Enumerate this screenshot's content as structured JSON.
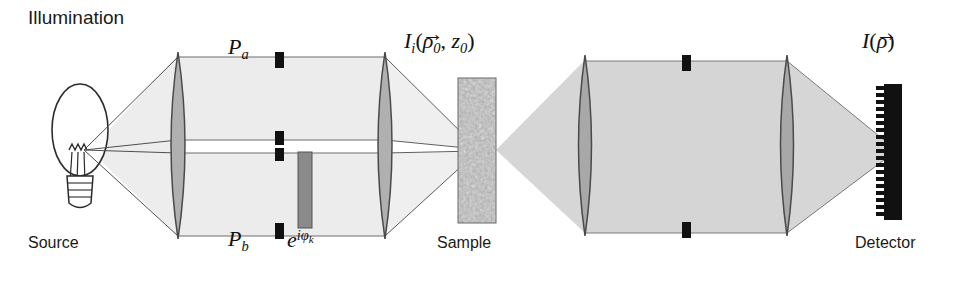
{
  "figure": {
    "width": 975,
    "height": 286,
    "background": "#ffffff",
    "title": "Illumination"
  },
  "colors": {
    "beam_fill": "#e9e9e9",
    "beam_fill_dark": "#d3d3d3",
    "lens_fill": "#b3b3b3",
    "lens_stroke": "#555555",
    "stop_black": "#111111",
    "phase_mask": "#8c8c8c",
    "ray_stroke": "#666666",
    "outline": "#2b2b2b",
    "text": "#1a1a1a",
    "detector_body": "#111111"
  },
  "labels": {
    "illumination": "Illumination",
    "source": "Source",
    "sample": "Sample",
    "detector": "Detector",
    "aperture_top": {
      "symbol": "P",
      "subscript": "a"
    },
    "aperture_bottom": {
      "symbol": "P",
      "subscript": "b"
    },
    "phase_mask": {
      "base": "e",
      "exponent": "iφ",
      "exponent_sub": "k"
    },
    "illumination_intensity": {
      "symbol": "I",
      "subscript": "i",
      "open": "(",
      "arg1": "ρ",
      "arg1_sub": "0",
      "comma": ", ",
      "arg2": "z",
      "arg2_sub": "0",
      "close": ")"
    },
    "detected_intensity": {
      "symbol": "I",
      "open": "(",
      "arg1": "ρ",
      "close": ")"
    },
    "vector_arrow": "→"
  },
  "components": [
    {
      "name": "source-bulb",
      "type": "incandescent-lamp",
      "label": "Source",
      "cx": 82,
      "cy": 145
    },
    {
      "name": "lens-1",
      "type": "biconvex-lens",
      "cx": 178,
      "cy": 145,
      "height": 185
    },
    {
      "name": "aperture-stop-pa",
      "type": "aperture-stop",
      "cx": 280,
      "cy": 62,
      "label": "P_a"
    },
    {
      "name": "aperture-stop-mid-upper",
      "type": "aperture-stop",
      "cx": 280,
      "cy": 139
    },
    {
      "name": "aperture-stop-mid-lower",
      "type": "aperture-stop",
      "cx": 280,
      "cy": 154
    },
    {
      "name": "aperture-stop-pb",
      "type": "aperture-stop",
      "cx": 280,
      "cy": 231,
      "label": "P_b"
    },
    {
      "name": "phase-mask",
      "type": "phase-plate",
      "cx": 305,
      "cy": 188,
      "label": "e^{iφ_k}"
    },
    {
      "name": "lens-2",
      "type": "biconvex-lens",
      "cx": 385,
      "cy": 145,
      "height": 185
    },
    {
      "name": "sample",
      "type": "speckle-slab",
      "cx": 477,
      "cy": 150,
      "label": "Sample"
    },
    {
      "name": "lens-3",
      "type": "biconvex-lens",
      "cx": 585,
      "cy": 145,
      "height": 185
    },
    {
      "name": "aperture-stop-upper-right",
      "type": "aperture-stop",
      "cx": 686,
      "cy": 64
    },
    {
      "name": "aperture-stop-lower-right",
      "type": "aperture-stop",
      "cx": 686,
      "cy": 228
    },
    {
      "name": "lens-4",
      "type": "biconvex-lens",
      "cx": 787,
      "cy": 145,
      "height": 185
    },
    {
      "name": "detector-array",
      "type": "pixel-array",
      "cx": 890,
      "cy": 150,
      "label": "Detector",
      "pixels": 20
    }
  ]
}
